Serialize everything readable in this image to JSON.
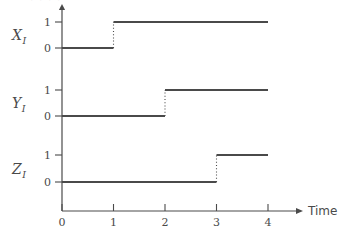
{
  "figure": {
    "cropped_header_text": "· · · ·",
    "background_color": "#ffffff",
    "line_color": "#4a4a4a",
    "axis_color": "#4a4a4a"
  },
  "axis": {
    "time_label": "Time",
    "x_ticks": [
      "0",
      "1",
      "2",
      "3",
      "4"
    ],
    "level_high": "1",
    "level_low": "0"
  },
  "series": [
    {
      "name": "X",
      "subscript": "I",
      "label": "X_I",
      "high_label": "1",
      "low_label": "0"
    },
    {
      "name": "Y",
      "subscript": "I",
      "label": "Y_I",
      "high_label": "1",
      "low_label": "0"
    },
    {
      "name": "Z",
      "subscript": "I",
      "label": "Z_I",
      "high_label": "1",
      "low_label": "0"
    }
  ],
  "chart_data": {
    "type": "line",
    "title": "",
    "subtitle": "",
    "xlabel": "Time",
    "ylabel": "",
    "xlim": [
      0,
      4
    ],
    "ylim": [
      0,
      1
    ],
    "grid": false,
    "legend": "none",
    "step_style": "post",
    "transition_line_style": "dotted",
    "x_tick_values": [
      0,
      1,
      2,
      3,
      4
    ],
    "y_tick_values": [
      0,
      1
    ],
    "panels": [
      {
        "name": "X_I",
        "y_tick_labels": [
          "0",
          "1"
        ],
        "x": [
          0,
          1,
          1,
          4
        ],
        "y": [
          0,
          0,
          1,
          1
        ],
        "transition_time": 1,
        "value_before": 0,
        "value_after": 1
      },
      {
        "name": "Y_I",
        "y_tick_labels": [
          "0",
          "1"
        ],
        "x": [
          0,
          2,
          2,
          4
        ],
        "y": [
          0,
          0,
          1,
          1
        ],
        "transition_time": 2,
        "value_before": 0,
        "value_after": 1
      },
      {
        "name": "Z_I",
        "y_tick_labels": [
          "0",
          "1"
        ],
        "x": [
          0,
          3,
          3,
          4
        ],
        "y": [
          0,
          0,
          1,
          1
        ],
        "transition_time": 3,
        "value_before": 0,
        "value_after": 1
      }
    ]
  },
  "geometry": {
    "axis_x": 62,
    "axis_y_bottom": 211,
    "tick_spacing": 51.5,
    "panels_px": [
      {
        "high_y": 22,
        "low_y": 48,
        "label_x": 12,
        "label_y": 40
      },
      {
        "high_y": 90,
        "low_y": 116,
        "label_x": 12,
        "label_y": 108
      },
      {
        "high_y": 155,
        "low_y": 182,
        "label_x": 12,
        "label_y": 174
      }
    ]
  }
}
